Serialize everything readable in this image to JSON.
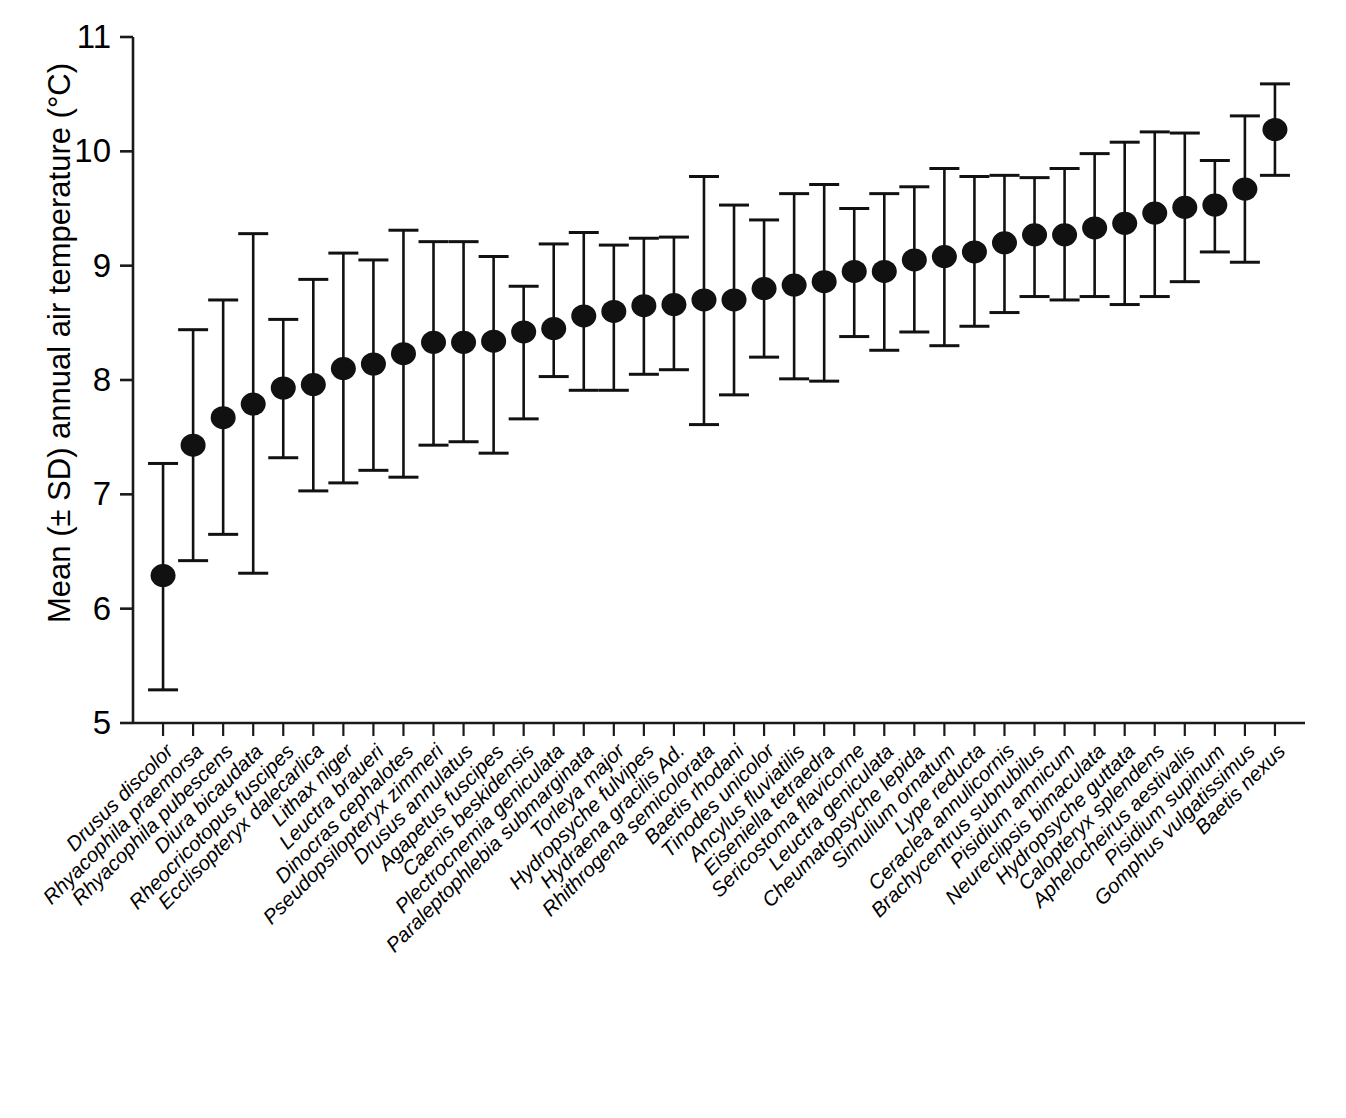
{
  "axes": {
    "ylabel": "Mean (± SD) annual air temperature (°C)",
    "xlabel": "",
    "y_ticks": [
      "5",
      "6",
      "7",
      "8",
      "9",
      "10",
      "11"
    ]
  },
  "chart_data": {
    "type": "scatter",
    "title": "",
    "xlabel": "",
    "ylabel": "Mean (± SD) annual air temperature (°C)",
    "ylim": [
      5,
      11
    ],
    "yticks": [
      5,
      6,
      7,
      8,
      9,
      10,
      11
    ],
    "grid": false,
    "legend": null,
    "error_type": "SD",
    "marker": "filled-circle",
    "categories": [
      "Drusus discolor",
      "Rhyacophila praemorsa",
      "Rhyacophila pubescens",
      "Diura bicaudata",
      "Rheocricotopus fuscipes",
      "Ecclisopteryx dalecarlica",
      "Lithax niger",
      "Leuctra braueri",
      "Dinocras cephalotes",
      "Pseudopsilopteryx zimmeri",
      "Drusus annulatus",
      "Agapetus fuscipes",
      "Caenis beskidensis",
      "Plectrocnemia geniculata",
      "Paraleptophlebia submarginata",
      "Torleya major",
      "Hydropsyche fulvipes",
      "Hydraena gracilis Ad.",
      "Rhithrogena semicolorata",
      "Baetis rhodani",
      "Tinodes unicolor",
      "Ancylus fluviatilis",
      "Eiseniella tetraedra",
      "Sericostoma flavicorne",
      "Leuctra geniculata",
      "Cheumatopsyche lepida",
      "Simulium ornatum",
      "Lype reducta",
      "Ceraclea annulicornis",
      "Brachycentrus subnubilus",
      "Pisidium amnicum",
      "Neureclipsis bimaculata",
      "Hydropsyche guttata",
      "Calopteryx splendens",
      "Aphelocheirus aestivalis",
      "Pisidium supinum",
      "Gomphus vulgatissimus",
      "Baetis nexus"
    ],
    "values": [
      6.29,
      7.43,
      7.67,
      7.79,
      7.93,
      7.96,
      8.1,
      8.14,
      8.23,
      8.33,
      8.33,
      8.34,
      8.42,
      8.45,
      8.56,
      8.6,
      8.65,
      8.66,
      8.7,
      8.7,
      8.8,
      8.83,
      8.86,
      8.95,
      8.95,
      9.05,
      9.08,
      9.12,
      9.2,
      9.27,
      9.27,
      9.33,
      9.37,
      9.46,
      9.51,
      9.53,
      9.67,
      10.19
    ],
    "errors_upper": [
      7.27,
      8.44,
      8.7,
      9.28,
      8.53,
      8.88,
      9.11,
      9.05,
      9.31,
      9.21,
      9.21,
      9.08,
      8.82,
      9.19,
      9.29,
      9.18,
      9.24,
      9.25,
      9.78,
      9.53,
      9.4,
      9.63,
      9.71,
      9.5,
      9.63,
      9.69,
      9.85,
      9.78,
      9.79,
      9.77,
      9.85,
      9.98,
      10.08,
      10.17,
      10.16,
      9.92,
      10.31,
      10.59
    ],
    "errors_lower": [
      5.29,
      6.42,
      6.65,
      6.31,
      7.32,
      7.03,
      7.1,
      7.21,
      7.15,
      7.43,
      7.46,
      7.36,
      7.66,
      8.03,
      7.91,
      7.91,
      8.05,
      8.09,
      7.61,
      7.87,
      8.2,
      8.01,
      7.99,
      8.38,
      8.26,
      8.42,
      8.3,
      8.47,
      8.59,
      8.73,
      8.7,
      8.73,
      8.66,
      8.73,
      8.86,
      9.12,
      9.03,
      9.79
    ]
  }
}
